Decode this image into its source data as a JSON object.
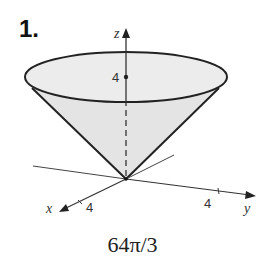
{
  "problem": {
    "number": "1.",
    "answer": "64π/3"
  },
  "figure": {
    "axes": {
      "z_label": "z",
      "x_label": "x",
      "y_label": "y"
    },
    "ticks": {
      "z_tick": "4",
      "x_tick": "4",
      "y_tick": "4"
    },
    "colors": {
      "fill": "#e6e6e6",
      "stroke": "#222222"
    }
  }
}
